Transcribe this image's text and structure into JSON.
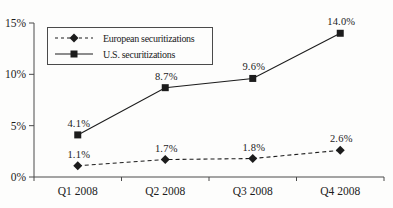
{
  "chart_data": {
    "type": "line",
    "categories": [
      "Q1 2008",
      "Q2 2008",
      "Q3 2008",
      "Q4 2008"
    ],
    "series": [
      {
        "name": "European securitizations",
        "values": [
          1.1,
          1.7,
          1.8,
          2.6
        ],
        "labels": [
          "1.1%",
          "1.7%",
          "1.8%",
          "2.6%"
        ],
        "line_style": "dashed",
        "marker": "diamond"
      },
      {
        "name": "U.S. securitizations",
        "values": [
          4.1,
          8.7,
          9.6,
          14.0
        ],
        "labels": [
          "4.1%",
          "8.7%",
          "9.6%",
          "14.0%"
        ],
        "line_style": "solid",
        "marker": "square"
      }
    ],
    "title": "",
    "xlabel": "",
    "ylabel": "",
    "ylim": [
      0,
      15
    ],
    "yticks": {
      "values": [
        0,
        5,
        10,
        15
      ],
      "labels": [
        "0%",
        "5%",
        "10%",
        "15%"
      ]
    },
    "grid": false,
    "legend_position": "top-left",
    "ink_color": "#1c1c1c",
    "axis_color": "#4a4a4a",
    "background_color": "#fdfdfc"
  }
}
